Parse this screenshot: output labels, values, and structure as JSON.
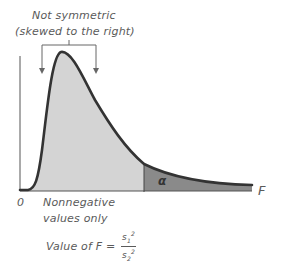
{
  "annotation": {
    "line1": "Not symmetric",
    "line2": "(skewed to the right)"
  },
  "axis": {
    "origin_label": "0",
    "x_label": "F"
  },
  "region": {
    "tail_label": "α"
  },
  "notes": {
    "nonnegative_line1": "Nonnegative",
    "nonnegative_line2": "values only",
    "formula_prefix": "Value of F =",
    "numerator": "s",
    "numerator_sub": "1",
    "numerator_sup": "2",
    "denominator": "s",
    "denominator_sub": "2",
    "denominator_sup": "2"
  },
  "colors": {
    "body_fill": "#d4d4d4",
    "tail_fill": "#8a8a8a",
    "curve": "#333333"
  }
}
